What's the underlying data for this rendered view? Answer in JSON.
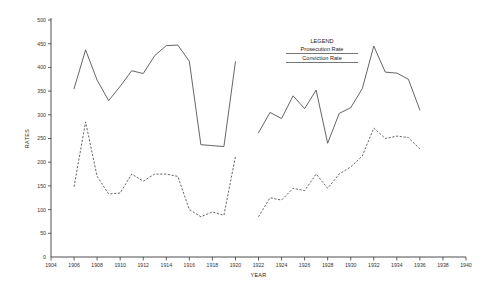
{
  "chart_data": {
    "type": "line",
    "title": "",
    "xlabel": "YEAR",
    "ylabel": "RATES",
    "xlim": [
      1904,
      1940
    ],
    "ylim": [
      0,
      500
    ],
    "grid": false,
    "legend_position": "top-center",
    "legend_title": "LEGEND",
    "xticks": [
      1904,
      1906,
      1908,
      1910,
      1912,
      1914,
      1916,
      1918,
      1920,
      1922,
      1924,
      1926,
      1928,
      1930,
      1932,
      1934,
      1936,
      1938,
      1940
    ],
    "xtick_labels": [
      "1904",
      "1906",
      "1908",
      "1910",
      "1912",
      "1914",
      "1916",
      "1918",
      "1920",
      "1922",
      "1924",
      "1926",
      "1928",
      "1930",
      "1932",
      "1934",
      "1936",
      "1938",
      "1940"
    ],
    "yticks": [
      0,
      50,
      100,
      150,
      200,
      250,
      300,
      350,
      400,
      450,
      500
    ],
    "ytick_labels": [
      "0",
      "50",
      "100",
      "150",
      "200",
      "250",
      "300",
      "350",
      "400",
      "450",
      "500"
    ],
    "origin_label": "0",
    "series": [
      {
        "name": "Prosecution Rate",
        "style": "solid",
        "color": "#4a4a4a",
        "segments": [
          {
            "x": [
              1906,
              1907,
              1908,
              1909,
              1910,
              1911,
              1912,
              1913,
              1914,
              1915,
              1916,
              1917,
              1918,
              1919,
              1920
            ],
            "values": [
              355,
              437,
              373,
              330,
              360,
              393,
              387,
              425,
              446,
              447,
              413,
              237,
              235,
              233,
              412
            ]
          }
        ]
      },
      {
        "name": "Prosecution Rate",
        "style": "solid",
        "color": "#4a4a4a",
        "segments": [
          {
            "x": [
              1922,
              1923,
              1924,
              1925,
              1926,
              1927,
              1928,
              1929,
              1930,
              1931,
              1932,
              1933,
              1934,
              1935,
              1936
            ],
            "values": [
              262,
              305,
              292,
              340,
              313,
              352,
              240,
              303,
              315,
              355,
              445,
              390,
              388,
              375,
              310
            ]
          }
        ]
      },
      {
        "name": "Conviction Rate",
        "style": "dashed",
        "color": "#4a4a4a",
        "segments": [
          {
            "x": [
              1906,
              1907,
              1908,
              1909,
              1910,
              1911,
              1912,
              1913,
              1914,
              1915,
              1916,
              1917,
              1918,
              1919,
              1920
            ],
            "values": [
              148,
              285,
              170,
              133,
              135,
              175,
              160,
              175,
              175,
              170,
              100,
              85,
              95,
              88,
              212
            ]
          }
        ]
      },
      {
        "name": "Conviction Rate",
        "style": "dashed",
        "color": "#4a4a4a",
        "segments": [
          {
            "x": [
              1922,
              1923,
              1924,
              1925,
              1926,
              1927,
              1928,
              1929,
              1930,
              1931,
              1932,
              1933,
              1934,
              1935,
              1936
            ],
            "values": [
              85,
              125,
              120,
              145,
              140,
              175,
              145,
              175,
              190,
              213,
              272,
              250,
              255,
              252,
              228
            ]
          }
        ]
      }
    ]
  },
  "legend": {
    "title": "LEGEND",
    "entries": [
      {
        "label": "Prosecution Rate",
        "style": "solid"
      },
      {
        "label": "Conviction Rate",
        "style": "dashed"
      }
    ]
  },
  "axes": {
    "y_title": "RATES",
    "x_title": "YEAR"
  }
}
